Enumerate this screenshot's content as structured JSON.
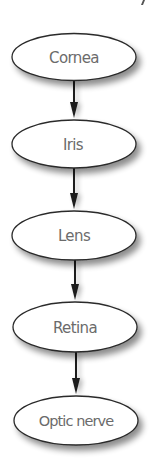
{
  "diagram": {
    "type": "vertical-flowchart",
    "direction": "top-to-bottom",
    "colors": {
      "node_fill": "#ffffff",
      "node_stroke": "#2a2a2a",
      "text": "#6b6b6b",
      "arrow": "#1a1a1a",
      "shadow": "#9a9a9a"
    },
    "nodes": [
      {
        "id": "cornea",
        "label": "Cornea"
      },
      {
        "id": "iris",
        "label": "Iris"
      },
      {
        "id": "lens",
        "label": "Lens"
      },
      {
        "id": "retina",
        "label": "Retina"
      },
      {
        "id": "optic-nerve",
        "label": "Optic nerve"
      }
    ],
    "edges": [
      {
        "from": "cornea",
        "to": "iris"
      },
      {
        "from": "iris",
        "to": "lens"
      },
      {
        "from": "lens",
        "to": "retina"
      },
      {
        "from": "retina",
        "to": "optic-nerve"
      }
    ]
  }
}
